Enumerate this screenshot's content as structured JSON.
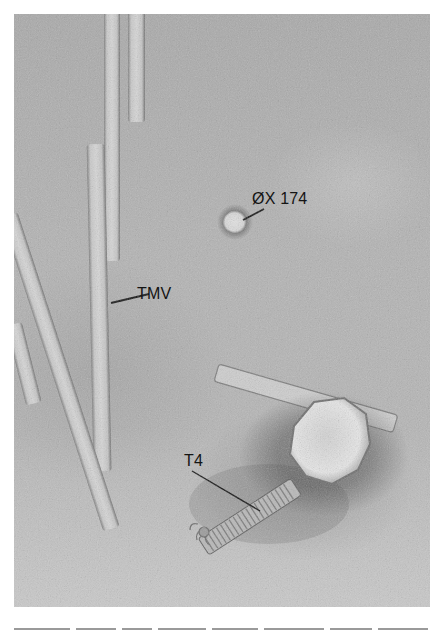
{
  "figure": {
    "type": "electron micrograph",
    "background_color": "#b2b2b2",
    "labels": {
      "phix174": "ØX 174",
      "tmv": "TMV",
      "t4": "T4"
    }
  },
  "caption": {
    "text": "",
    "truncated": true
  }
}
